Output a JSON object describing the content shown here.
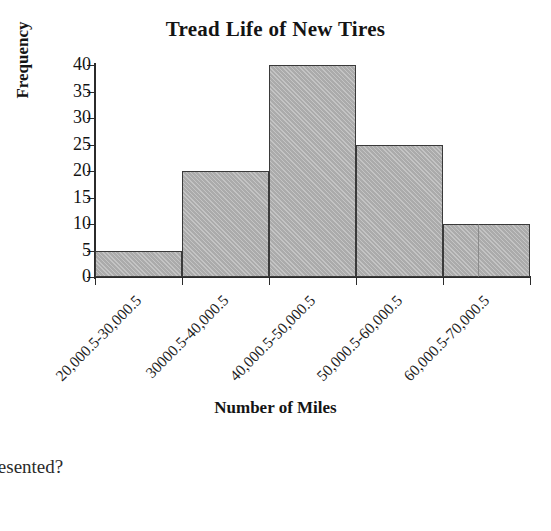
{
  "chart_data": {
    "type": "bar",
    "title": "Tread Life of New Tires",
    "xlabel": "Number of Miles",
    "ylabel": "Frequency",
    "categories": [
      "20,000.5-30,000.5",
      "30000.5-40,000.5",
      "40,000.5-50,000.5",
      "50,000.5-60,000.5",
      "60,000.5-70,000.5"
    ],
    "values": [
      5,
      20,
      40,
      25,
      10
    ],
    "yticks": [
      0,
      5,
      10,
      15,
      20,
      25,
      30,
      35,
      40
    ],
    "ylim": [
      0,
      40
    ],
    "grid": false,
    "legend": false,
    "bar_fill_color": "#b4b4b4",
    "bar_edge_color": "#3a3a3a",
    "axis_color": "#2b2b2b",
    "text_color": "#141414",
    "background_color": "#ffffff",
    "style": "histogram, adjacent touching bars, rotated x tick labels"
  },
  "page": {
    "clipped_text": "presented?"
  }
}
